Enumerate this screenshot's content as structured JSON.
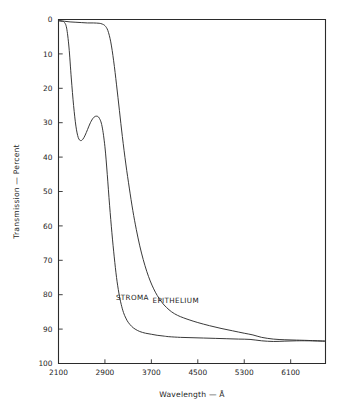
{
  "chart_data": {
    "type": "line",
    "title": "",
    "xlabel": "Wavelength — Å",
    "ylabel": "Transmission — Percent",
    "xlim": [
      2100,
      6700
    ],
    "ylim": [
      0,
      100
    ],
    "y_inverted": true,
    "grid": false,
    "legend_position": "inline-annotation",
    "x_ticks": [
      2100,
      2900,
      3700,
      4500,
      5300,
      6100
    ],
    "x_tick_labels": [
      "2100",
      "2900",
      "3700",
      "4500",
      "5300",
      "6100"
    ],
    "y_ticks": [
      0,
      10,
      20,
      30,
      40,
      50,
      60,
      70,
      80,
      90,
      100
    ],
    "y_tick_labels": [
      "0",
      "10",
      "20",
      "30",
      "40",
      "50",
      "60",
      "70",
      "80",
      "90",
      "100"
    ],
    "series": [
      {
        "name": "STROMA",
        "label": "STROMA",
        "label_x": 3090,
        "label_y": 81.5,
        "x": [
          2100,
          2160,
          2200,
          2240,
          2280,
          2320,
          2360,
          2400,
          2440,
          2480,
          2520,
          2560,
          2600,
          2650,
          2700,
          2750,
          2800,
          2850,
          2900,
          2940,
          2980,
          3020,
          3060,
          3100,
          3140,
          3180,
          3220,
          3260,
          3300,
          3360,
          3420,
          3500,
          3600,
          3700,
          3800,
          3900,
          4000,
          4200,
          4400,
          4600,
          4800,
          5000,
          5200,
          5400,
          5600,
          5800,
          6000,
          6200,
          6400,
          6700
        ],
        "y": [
          0.4,
          0.5,
          0.8,
          2.5,
          8.0,
          17.0,
          25.0,
          31.0,
          34.3,
          35.2,
          34.8,
          33.6,
          32.0,
          30.0,
          28.6,
          28.1,
          28.6,
          31.0,
          37.0,
          45.0,
          54.0,
          62.0,
          69.0,
          75.0,
          79.5,
          82.8,
          85.2,
          86.8,
          88.0,
          89.2,
          90.0,
          90.7,
          91.2,
          91.5,
          91.8,
          92.0,
          92.2,
          92.4,
          92.5,
          92.6,
          92.7,
          92.8,
          92.9,
          93.0,
          93.4,
          93.6,
          93.5,
          93.4,
          93.4,
          93.5
        ]
      },
      {
        "name": "EPITHELIUM",
        "label": "EPITHELIUM",
        "label_x": 3720,
        "label_y": 82.5,
        "x": [
          2100,
          2200,
          2300,
          2400,
          2500,
          2600,
          2700,
          2800,
          2850,
          2900,
          2950,
          3000,
          3050,
          3100,
          3150,
          3200,
          3260,
          3320,
          3380,
          3440,
          3500,
          3560,
          3620,
          3680,
          3740,
          3800,
          3880,
          3960,
          4050,
          4150,
          4250,
          4350,
          4500,
          4700,
          4900,
          5100,
          5300,
          5450,
          5600,
          5800,
          6000,
          6200,
          6400,
          6700
        ],
        "y": [
          0.3,
          0.5,
          0.7,
          0.8,
          0.9,
          1.0,
          1.0,
          1.1,
          1.3,
          1.8,
          3.2,
          6.5,
          12.0,
          19.0,
          26.5,
          34.0,
          42.0,
          49.0,
          55.5,
          61.0,
          65.8,
          69.8,
          73.2,
          76.0,
          78.3,
          80.2,
          82.2,
          83.7,
          85.0,
          86.0,
          86.7,
          87.3,
          88.1,
          89.0,
          89.8,
          90.5,
          91.2,
          91.7,
          92.4,
          92.9,
          93.1,
          93.2,
          93.3,
          93.5
        ]
      }
    ],
    "colors": {
      "curve": "#2e2e2e",
      "axis": "#2b2b2b",
      "text": "#1e1e1e",
      "background": "#ffffff"
    }
  }
}
